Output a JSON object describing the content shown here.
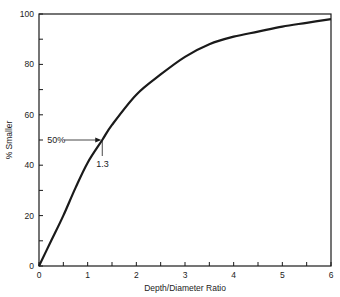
{
  "chart_data": {
    "type": "line",
    "title": "",
    "xlabel": "Depth/Diameter Ratio",
    "ylabel": "% Smaller",
    "xlim": [
      0,
      6
    ],
    "ylim": [
      0,
      100
    ],
    "x_ticks": [
      "0",
      "1",
      "2",
      "3",
      "4",
      "5",
      "6"
    ],
    "y_ticks": [
      "0",
      "20",
      "40",
      "60",
      "80",
      "100"
    ],
    "grid": false,
    "series": [
      {
        "name": "% Smaller",
        "x": [
          0,
          0.25,
          0.5,
          0.75,
          1.0,
          1.3,
          1.5,
          2.0,
          2.5,
          3.0,
          3.5,
          4.0,
          4.5,
          5.0,
          5.5,
          6.0
        ],
        "y": [
          0,
          10,
          20,
          31,
          41,
          50,
          56,
          68,
          76,
          83,
          88,
          91,
          93,
          95,
          96.5,
          98
        ]
      }
    ],
    "annotations": [
      {
        "text": "50%",
        "type": "arrow",
        "points_to": {
          "x": 1.3,
          "y": 50
        }
      },
      {
        "text": "1.3",
        "type": "drop-line",
        "at": {
          "x": 1.3,
          "y": 50
        }
      }
    ]
  }
}
